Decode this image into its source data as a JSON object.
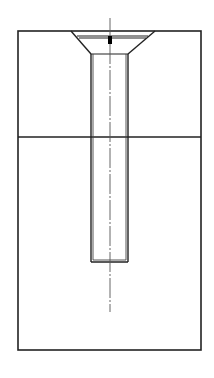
{
  "diagram": {
    "type": "technical-drawing",
    "colors": {
      "background": "#ffffff",
      "line": "#222222",
      "centerline": "#555555",
      "mark": "#000000"
    },
    "outline": {
      "x": 18,
      "y": 31,
      "width": 183,
      "height": 319
    },
    "divider_y": 137,
    "countersink": {
      "top_left_x": 71,
      "top_right_x": 155,
      "top_y": 31,
      "bottom_left_x": 91,
      "bottom_right_x": 128,
      "bottom_y": 54
    },
    "head_lines": [
      {
        "x1": 77,
        "x2": 148,
        "y": 36
      },
      {
        "x1": 79,
        "x2": 146,
        "y": 38
      }
    ],
    "shaft": {
      "outer_left_x": 91,
      "outer_right_x": 128,
      "inner_left_x": 93,
      "inner_right_x": 126,
      "top_y": 54,
      "bottom_y": 262
    },
    "centerline": {
      "x": 110,
      "y1": 18,
      "y2": 312
    },
    "center_mark": {
      "x": 108,
      "y": 36,
      "width": 4,
      "height": 8
    }
  }
}
